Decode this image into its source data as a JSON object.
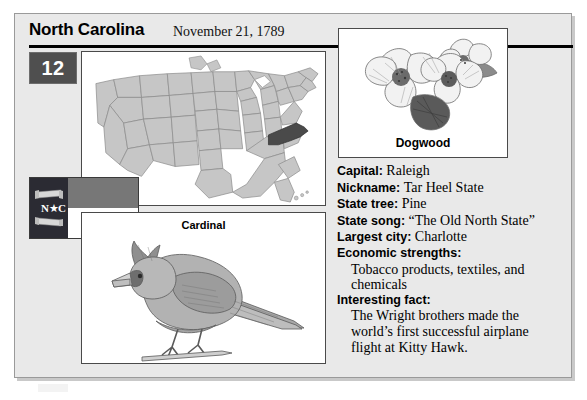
{
  "header": {
    "state_name": "North Carolina",
    "statehood_date": "November 21, 1789",
    "order_number": "12"
  },
  "map": {
    "caption": "",
    "highlighted_state": "North Carolina",
    "base_color": "#c6c6c6",
    "highlight_color": "#4a4a4a",
    "outline_color": "#8a8a8a"
  },
  "flag": {
    "name": "North Carolina state flag",
    "hoist_letters": "N ★ C",
    "hoist_color": "#2b2b33",
    "top_stripe_color": "#777777",
    "bottom_stripe_color": "#ffffff",
    "top_scroll_text": "MAY 20TH 1775",
    "bottom_scroll_text": "APRIL 12TH 1776"
  },
  "bird": {
    "caption": "Cardinal"
  },
  "flower": {
    "caption": "Dogwood"
  },
  "facts": [
    {
      "label": "Capital:",
      "value": "Raleigh"
    },
    {
      "label": "Nickname:",
      "value": "Tar Heel State"
    },
    {
      "label": "State tree:",
      "value": "Pine"
    },
    {
      "label": "State song:",
      "value": "“The Old North State”"
    },
    {
      "label": "Largest city:",
      "value": "Charlotte"
    }
  ],
  "sections": [
    {
      "heading": "Economic strengths:",
      "lines": [
        "Tobacco products, textiles, and",
        "chemicals"
      ]
    },
    {
      "heading": "Interesting fact:",
      "lines": [
        "The Wright brothers made the",
        "world’s first successful airplane",
        "flight at Kitty Hawk."
      ]
    }
  ]
}
